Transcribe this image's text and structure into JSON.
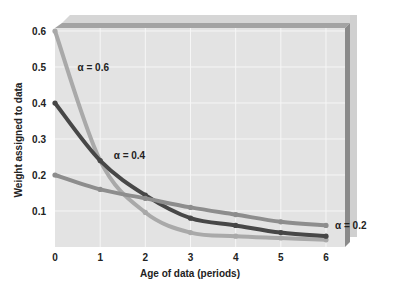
{
  "chart_data": {
    "type": "line",
    "title": "",
    "xlabel": "Age of data (periods)",
    "ylabel": "Weight assigned to data",
    "x": [
      0,
      1,
      2,
      3,
      4,
      5,
      6
    ],
    "xlim": [
      0,
      6
    ],
    "ylim": [
      0,
      0.6
    ],
    "x_ticks": [
      "0",
      "1",
      "2",
      "3",
      "4",
      "5",
      "6"
    ],
    "y_ticks": [
      {
        "value": 0.1,
        "label": "0.1"
      },
      {
        "value": 0.2,
        "label": "0.2"
      },
      {
        "value": 0.3,
        "label": "0.3"
      },
      {
        "value": 0.4,
        "label": "0.4"
      },
      {
        "value": 0.5,
        "label": "0.5"
      },
      {
        "value": 0.6,
        "label": "0.6"
      }
    ],
    "grid": true,
    "series": [
      {
        "name": "α = 0.6",
        "label": "α = 0.6",
        "color": "#a9a9a9",
        "values": [
          0.6,
          0.24,
          0.096,
          0.04,
          0.03,
          0.025,
          0.02
        ],
        "label_at": {
          "x": 0.5,
          "y": 0.5
        }
      },
      {
        "name": "α = 0.4",
        "label": "α = 0.4",
        "color": "#474747",
        "values": [
          0.4,
          0.24,
          0.144,
          0.08,
          0.06,
          0.04,
          0.03
        ],
        "label_at": {
          "x": 1.3,
          "y": 0.255
        }
      },
      {
        "name": "α = 0.2",
        "label": "α = 0.2",
        "color": "#8d8d8d",
        "values": [
          0.2,
          0.16,
          0.135,
          0.11,
          0.09,
          0.07,
          0.06
        ],
        "label_at": {
          "x": 6.2,
          "y": 0.06
        }
      }
    ],
    "legend": "inline-labels"
  }
}
